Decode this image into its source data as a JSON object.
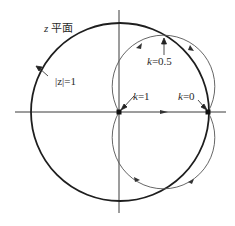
{
  "diagram": {
    "title_var": "z",
    "title_text": "平面",
    "unit_circle_label": "|z|=1",
    "labels": {
      "k05": {
        "var": "k",
        "text": "=0.5"
      },
      "k1": {
        "var": "k",
        "text": "=1"
      },
      "k0": {
        "var": "k",
        "text": "=0"
      }
    },
    "colors": {
      "unit_circle": "#1e1e1e",
      "locus": "#555555",
      "axis": "#3a3a3a",
      "text": "#2a2a2a"
    }
  }
}
